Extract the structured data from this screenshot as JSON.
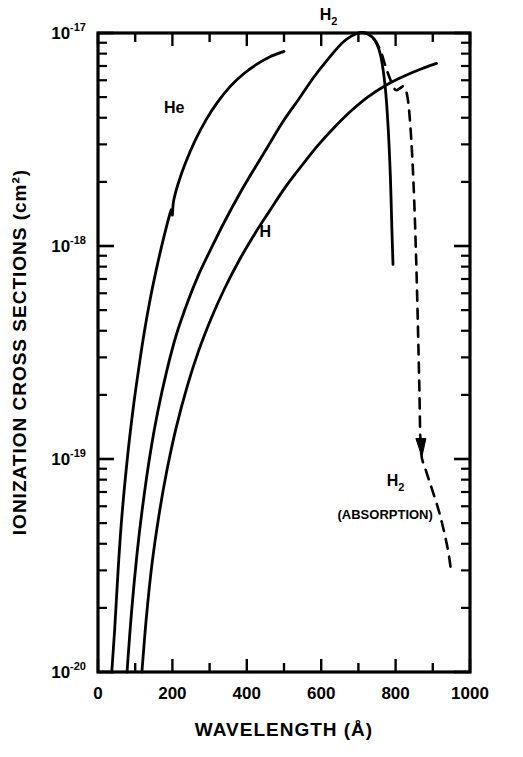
{
  "chart_data": {
    "type": "line",
    "title": "",
    "xlabel": "WAVELENGTH (Å)",
    "ylabel": "IONIZATION CROSS SECTIONS (cm²)",
    "xlim": [
      0,
      1000
    ],
    "ylim": [
      1e-20,
      1e-17
    ],
    "yscale": "log",
    "xscale": "linear",
    "grid": false,
    "legend": "inline-curve-labels",
    "xticks": [
      0,
      200,
      400,
      600,
      800,
      1000
    ],
    "xticklabels": [
      "0",
      "200",
      "400",
      "600",
      "800",
      "1000"
    ],
    "xminor_step": 100,
    "yticks": [
      1e-17,
      1e-18,
      1e-19,
      1e-20
    ],
    "yticklabels": [
      "10-17",
      "10-18",
      "10-19",
      "10-20"
    ],
    "ytick_mantissa": "10",
    "ytick_exponents": [
      "-17",
      "-18",
      "-19",
      "-20"
    ],
    "series": [
      {
        "name": "He",
        "label": "He",
        "style": "solid",
        "color": "#000000",
        "label_x": 205,
        "label_y": 4.2e-18,
        "note": "small kink/zigzag near 200 Å",
        "points": [
          [
            37,
            1e-20
          ],
          [
            45,
            1.6e-20
          ],
          [
            55,
            3.2e-20
          ],
          [
            65,
            5.6e-20
          ],
          [
            80,
            1.05e-19
          ],
          [
            95,
            1.75e-19
          ],
          [
            110,
            2.7e-19
          ],
          [
            125,
            4e-19
          ],
          [
            140,
            5.6e-19
          ],
          [
            155,
            7.5e-19
          ],
          [
            170,
            9.8e-19
          ],
          [
            185,
            1.25e-18
          ],
          [
            197,
            1.48e-18
          ],
          [
            200,
            1.4e-18
          ],
          [
            203,
            1.62e-18
          ],
          [
            215,
            1.95e-18
          ],
          [
            235,
            2.45e-18
          ],
          [
            260,
            3.1e-18
          ],
          [
            290,
            3.9e-18
          ],
          [
            320,
            4.7e-18
          ],
          [
            355,
            5.6e-18
          ],
          [
            390,
            6.4e-18
          ],
          [
            425,
            7.1e-18
          ],
          [
            460,
            7.7e-18
          ],
          [
            500,
            8.2e-18
          ]
        ]
      },
      {
        "name": "H2",
        "label": "H2",
        "label_base": "H",
        "label_sub": "2",
        "style": "solid",
        "color": "#000000",
        "label_x": 620,
        "label_y": 1.15e-17,
        "note": "peaks at 1e-17 near 700 Å then falls steeply past 780 Å",
        "points": [
          [
            78,
            1e-20
          ],
          [
            90,
            1.9e-20
          ],
          [
            105,
            3.6e-20
          ],
          [
            120,
            6e-20
          ],
          [
            140,
            1.05e-19
          ],
          [
            160,
            1.65e-19
          ],
          [
            185,
            2.6e-19
          ],
          [
            210,
            3.8e-19
          ],
          [
            240,
            5.4e-19
          ],
          [
            270,
            7.3e-19
          ],
          [
            305,
            9.8e-19
          ],
          [
            340,
            1.3e-18
          ],
          [
            380,
            1.75e-18
          ],
          [
            420,
            2.3e-18
          ],
          [
            460,
            3e-18
          ],
          [
            500,
            3.9e-18
          ],
          [
            540,
            4.9e-18
          ],
          [
            580,
            6.2e-18
          ],
          [
            620,
            7.6e-18
          ],
          [
            660,
            9.1e-18
          ],
          [
            700,
            1e-17
          ],
          [
            725,
            9.9e-18
          ],
          [
            745,
            9.2e-18
          ],
          [
            760,
            7.8e-18
          ],
          [
            772,
            5.6e-18
          ],
          [
            780,
            3.6e-18
          ],
          [
            786,
            2.1e-18
          ],
          [
            790,
            1.2e-18
          ],
          [
            793,
            8.2e-19
          ]
        ]
      },
      {
        "name": "H",
        "label": "H",
        "style": "solid",
        "color": "#000000",
        "label_x": 450,
        "label_y": 1.1e-18,
        "points": [
          [
            118,
            1e-20
          ],
          [
            130,
            1.8e-20
          ],
          [
            145,
            3.2e-20
          ],
          [
            165,
            5.6e-20
          ],
          [
            185,
            8.8e-20
          ],
          [
            210,
            1.4e-19
          ],
          [
            240,
            2.2e-19
          ],
          [
            270,
            3.2e-19
          ],
          [
            305,
            4.6e-19
          ],
          [
            340,
            6.3e-19
          ],
          [
            380,
            8.6e-19
          ],
          [
            420,
            1.13e-18
          ],
          [
            460,
            1.45e-18
          ],
          [
            500,
            1.85e-18
          ],
          [
            545,
            2.35e-18
          ],
          [
            590,
            2.95e-18
          ],
          [
            635,
            3.6e-18
          ],
          [
            680,
            4.3e-18
          ],
          [
            725,
            5e-18
          ],
          [
            775,
            5.7e-18
          ],
          [
            825,
            6.3e-18
          ],
          [
            870,
            6.8e-18
          ],
          [
            910,
            7.2e-18
          ]
        ]
      },
      {
        "name": "H2-absorption",
        "label": "H2",
        "label_base": "H",
        "label_sub": "2",
        "sublabel": "(ABSORPTION)",
        "style": "dashed",
        "color": "#000000",
        "label_x": 800,
        "label_y": 7.5e-20,
        "sublabel_x": 772,
        "sublabel_y": 5.2e-20,
        "arrow_at": [
          868,
          1.05e-19
        ],
        "points": [
          [
            700,
            1e-17
          ],
          [
            722,
            1e-17
          ],
          [
            742,
            9.4e-18
          ],
          [
            760,
            8.2e-18
          ],
          [
            775,
            6.8e-18
          ],
          [
            790,
            5.8e-18
          ],
          [
            800,
            5.4e-18
          ],
          [
            812,
            5.5e-18
          ],
          [
            822,
            5.6e-18
          ],
          [
            832,
            5e-18
          ],
          [
            840,
            3.6e-18
          ],
          [
            848,
            2e-18
          ],
          [
            855,
            9e-19
          ],
          [
            860,
            4.2e-19
          ],
          [
            864,
            2.1e-19
          ],
          [
            868,
            1.1e-19
          ],
          [
            880,
            9e-20
          ],
          [
            898,
            7.2e-20
          ],
          [
            920,
            5.4e-20
          ],
          [
            940,
            3.8e-20
          ],
          [
            950,
            2.9e-20
          ]
        ]
      }
    ]
  },
  "figure": {
    "frame": {
      "left": 98,
      "right": 470,
      "top": 33,
      "bottom": 672
    },
    "background": "#ffffff",
    "line_color": "#000000"
  }
}
